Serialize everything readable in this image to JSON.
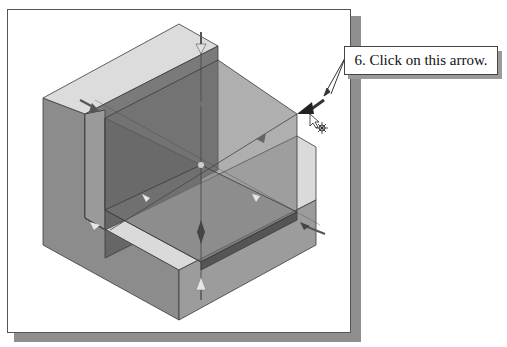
{
  "callout": {
    "step_text": "6. Click on this arrow."
  },
  "viewport": {
    "model": "L-shaped block with transparent datum planes",
    "highlighted_element": "plane-resize-arrow",
    "cursor": "pointer-with-drag-icon"
  },
  "colors": {
    "frame_border": "#555555",
    "frame_shadow": "#8f8f8f",
    "top_face": "#dcdcdc",
    "left_face": "#8a8a8a",
    "front_face": "#9a9a9a",
    "inner_face": "#6a6a6a",
    "plane_fill": "#777777",
    "arrow_dark": "#3a3a3a",
    "arrow_light": "#e6e6e6"
  }
}
